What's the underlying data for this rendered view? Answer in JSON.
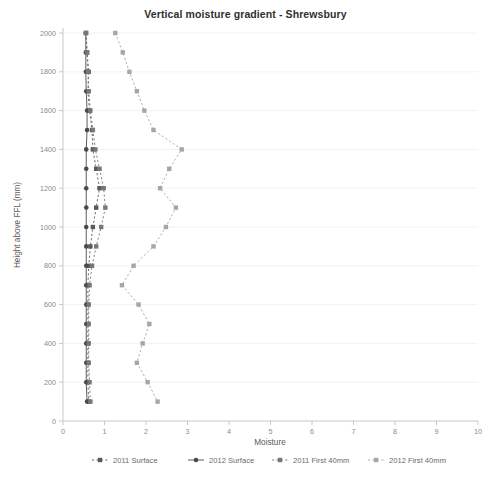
{
  "chart_data": {
    "type": "line",
    "title": "Vertical moisture gradient - Shrewsbury",
    "xlabel": "Moisture",
    "ylabel": "Height above FFL (mm)",
    "xlim": [
      0,
      10
    ],
    "ylim": [
      0,
      2000
    ],
    "xticks": [
      0,
      1,
      2,
      3,
      4,
      5,
      6,
      7,
      8,
      9,
      10
    ],
    "yticks": [
      0,
      200,
      400,
      600,
      800,
      1000,
      1200,
      1400,
      1600,
      1800,
      2000
    ],
    "grid": "horizontal-faint",
    "legend_position": "bottom",
    "orientation": "x=moisture, y=height",
    "series": [
      {
        "name": "2011 Surface",
        "color": "#595959",
        "line_style": "dashed",
        "marker": "square",
        "points": [
          {
            "y": 2000,
            "x": 0.55
          },
          {
            "y": 1900,
            "x": 0.58
          },
          {
            "y": 1800,
            "x": 0.62
          },
          {
            "y": 1700,
            "x": 0.6
          },
          {
            "y": 1600,
            "x": 0.64
          },
          {
            "y": 1500,
            "x": 0.7
          },
          {
            "y": 1400,
            "x": 0.72
          },
          {
            "y": 1300,
            "x": 0.8
          },
          {
            "y": 1200,
            "x": 0.88
          },
          {
            "y": 1100,
            "x": 0.8
          },
          {
            "y": 1000,
            "x": 0.72
          },
          {
            "y": 900,
            "x": 0.66
          },
          {
            "y": 800,
            "x": 0.62
          },
          {
            "y": 700,
            "x": 0.6
          },
          {
            "y": 600,
            "x": 0.6
          },
          {
            "y": 500,
            "x": 0.6
          },
          {
            "y": 400,
            "x": 0.6
          },
          {
            "y": 300,
            "x": 0.6
          },
          {
            "y": 200,
            "x": 0.6
          },
          {
            "y": 100,
            "x": 0.62
          }
        ]
      },
      {
        "name": "2012 Surface",
        "color": "#4a4a4a",
        "line_style": "solid",
        "marker": "circle",
        "points": [
          {
            "y": 2000,
            "x": 0.55
          },
          {
            "y": 1900,
            "x": 0.55
          },
          {
            "y": 1800,
            "x": 0.55
          },
          {
            "y": 1700,
            "x": 0.56
          },
          {
            "y": 1600,
            "x": 0.58
          },
          {
            "y": 1500,
            "x": 0.58
          },
          {
            "y": 1400,
            "x": 0.56
          },
          {
            "y": 1300,
            "x": 0.56
          },
          {
            "y": 1200,
            "x": 0.56
          },
          {
            "y": 1100,
            "x": 0.56
          },
          {
            "y": 1000,
            "x": 0.56
          },
          {
            "y": 900,
            "x": 0.56
          },
          {
            "y": 800,
            "x": 0.56
          },
          {
            "y": 700,
            "x": 0.56
          },
          {
            "y": 600,
            "x": 0.56
          },
          {
            "y": 500,
            "x": 0.56
          },
          {
            "y": 400,
            "x": 0.56
          },
          {
            "y": 300,
            "x": 0.56
          },
          {
            "y": 200,
            "x": 0.56
          },
          {
            "y": 100,
            "x": 0.58
          }
        ]
      },
      {
        "name": "2011 First 40mm",
        "color": "#777777",
        "line_style": "dashed",
        "marker": "square",
        "points": [
          {
            "y": 2000,
            "x": 0.56
          },
          {
            "y": 1900,
            "x": 0.58
          },
          {
            "y": 1800,
            "x": 0.6
          },
          {
            "y": 1700,
            "x": 0.62
          },
          {
            "y": 1600,
            "x": 0.66
          },
          {
            "y": 1500,
            "x": 0.72
          },
          {
            "y": 1400,
            "x": 0.78
          },
          {
            "y": 1300,
            "x": 0.88
          },
          {
            "y": 1200,
            "x": 0.98
          },
          {
            "y": 1100,
            "x": 1.02
          },
          {
            "y": 1000,
            "x": 0.92
          },
          {
            "y": 900,
            "x": 0.8
          },
          {
            "y": 800,
            "x": 0.7
          },
          {
            "y": 700,
            "x": 0.64
          },
          {
            "y": 600,
            "x": 0.62
          },
          {
            "y": 500,
            "x": 0.62
          },
          {
            "y": 400,
            "x": 0.62
          },
          {
            "y": 300,
            "x": 0.62
          },
          {
            "y": 200,
            "x": 0.64
          },
          {
            "y": 100,
            "x": 0.66
          }
        ]
      },
      {
        "name": "2012 First 40mm",
        "color": "#a6a6a6",
        "line_style": "dashed",
        "marker": "square",
        "points": [
          {
            "y": 2000,
            "x": 1.26
          },
          {
            "y": 1900,
            "x": 1.44
          },
          {
            "y": 1800,
            "x": 1.6
          },
          {
            "y": 1700,
            "x": 1.78
          },
          {
            "y": 1600,
            "x": 1.96
          },
          {
            "y": 1500,
            "x": 2.18
          },
          {
            "y": 1400,
            "x": 2.86
          },
          {
            "y": 1300,
            "x": 2.56
          },
          {
            "y": 1200,
            "x": 2.34
          },
          {
            "y": 1100,
            "x": 2.72
          },
          {
            "y": 1000,
            "x": 2.48
          },
          {
            "y": 900,
            "x": 2.18
          },
          {
            "y": 800,
            "x": 1.7
          },
          {
            "y": 700,
            "x": 1.42
          },
          {
            "y": 600,
            "x": 1.82
          },
          {
            "y": 500,
            "x": 2.08
          },
          {
            "y": 400,
            "x": 1.92
          },
          {
            "y": 300,
            "x": 1.78
          },
          {
            "y": 200,
            "x": 2.04
          },
          {
            "y": 100,
            "x": 2.28
          }
        ]
      }
    ]
  },
  "legend": {
    "items": [
      {
        "label": "2011 Surface"
      },
      {
        "label": "2012 Surface"
      },
      {
        "label": "2011 First 40mm"
      },
      {
        "label": "2012 First 40mm"
      }
    ]
  }
}
